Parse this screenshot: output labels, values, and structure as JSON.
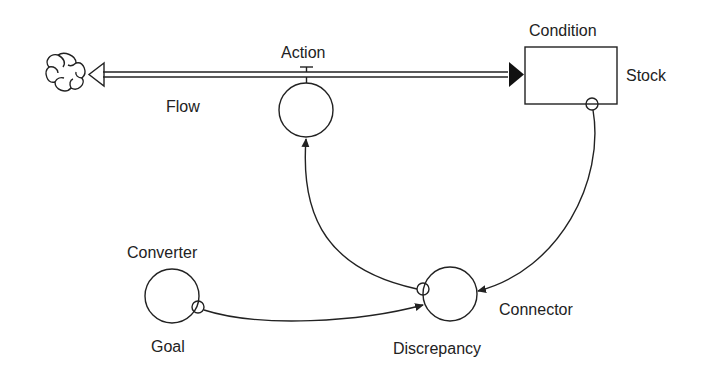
{
  "diagram": {
    "type": "stock-and-flow",
    "labels": {
      "action": "Action",
      "condition": "Condition",
      "stock": "Stock",
      "flow": "Flow",
      "converter": "Converter",
      "goal": "Goal",
      "connector": "Connector",
      "discrepancy": "Discrepancy"
    },
    "nodes": [
      {
        "id": "cloud",
        "kind": "source-sink",
        "icon": "cloud-icon"
      },
      {
        "id": "condition",
        "kind": "stock",
        "label": "Condition"
      },
      {
        "id": "action",
        "kind": "flow-converter",
        "label": "Action"
      },
      {
        "id": "goal",
        "kind": "converter",
        "label": "Goal"
      },
      {
        "id": "discrepancy",
        "kind": "converter",
        "label": "Discrepancy"
      }
    ],
    "edges": [
      {
        "from": "condition",
        "to": "cloud",
        "kind": "flow",
        "via": "action"
      },
      {
        "from": "condition",
        "to": "discrepancy",
        "kind": "connector"
      },
      {
        "from": "goal",
        "to": "discrepancy",
        "kind": "connector"
      },
      {
        "from": "discrepancy",
        "to": "action",
        "kind": "connector"
      }
    ],
    "colors": {
      "line": "#222222",
      "background": "#ffffff"
    }
  }
}
